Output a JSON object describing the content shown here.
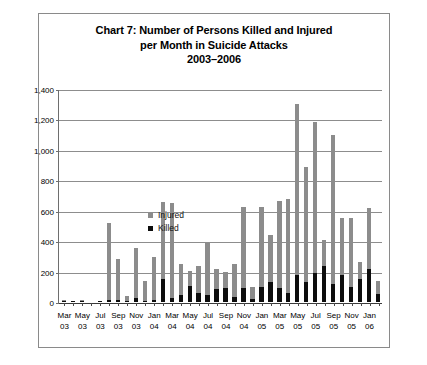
{
  "chart_data": {
    "type": "bar",
    "stacked": true,
    "title": "Chart 7: Number of Persons Killed and Injured per Month in Suicide Attacks 2003–2006",
    "title_lines": [
      "Chart 7: Number of Persons Killed and Injured",
      "per Month in Suicide Attacks",
      "2003–2006"
    ],
    "xlabel": "",
    "ylabel": "",
    "ylim": [
      0,
      1400
    ],
    "ytick_values": [
      0,
      200,
      400,
      600,
      800,
      1000,
      1200,
      1400
    ],
    "ytick_labels": [
      "0",
      "200",
      "400",
      "600",
      "800",
      "1,000",
      "1,200",
      "1,400"
    ],
    "grid": true,
    "legend_position": "upper-left-inside",
    "legend": [
      {
        "name": "Injured",
        "color": "#8c8c8c"
      },
      {
        "name": "Killed",
        "color": "#0d0d0d"
      }
    ],
    "categories": [
      "Mar 03",
      "Apr 03",
      "May 03",
      "Jun 03",
      "Jul 03",
      "Aug 03",
      "Sep 03",
      "Oct 03",
      "Nov 03",
      "Dec 03",
      "Jan 04",
      "Feb 04",
      "Mar 04",
      "Apr 04",
      "May 04",
      "Jun 04",
      "Jul 04",
      "Aug 04",
      "Sep 04",
      "Oct 04",
      "Nov 04",
      "Dec 04",
      "Jan 05",
      "Feb 05",
      "Mar 05",
      "Apr 05",
      "May 05",
      "Jun 05",
      "Jul 05",
      "Aug 05",
      "Sep 05",
      "Oct 05",
      "Nov 05",
      "Dec 05",
      "Jan 06",
      "Feb 06"
    ],
    "xtick_labels": [
      {
        "month": "Mar",
        "year": "03",
        "index": 0
      },
      {
        "month": "May",
        "year": "03",
        "index": 2
      },
      {
        "month": "Jul",
        "year": "03",
        "index": 4
      },
      {
        "month": "Sep",
        "year": "03",
        "index": 6
      },
      {
        "month": "Nov",
        "year": "03",
        "index": 8
      },
      {
        "month": "Jan",
        "year": "04",
        "index": 10
      },
      {
        "month": "Mar",
        "year": "04",
        "index": 12
      },
      {
        "month": "May",
        "year": "04",
        "index": 14
      },
      {
        "month": "Jul",
        "year": "04",
        "index": 16
      },
      {
        "month": "Sep",
        "year": "04",
        "index": 18
      },
      {
        "month": "Nov",
        "year": "04",
        "index": 20
      },
      {
        "month": "Jan",
        "year": "05",
        "index": 22
      },
      {
        "month": "Mar",
        "year": "05",
        "index": 24
      },
      {
        "month": "May",
        "year": "05",
        "index": 26
      },
      {
        "month": "Jul",
        "year": "05",
        "index": 28
      },
      {
        "month": "Sep",
        "year": "05",
        "index": 30
      },
      {
        "month": "Nov",
        "year": "05",
        "index": 32
      },
      {
        "month": "Jan",
        "year": "06",
        "index": 34
      }
    ],
    "series": [
      {
        "name": "Killed",
        "color": "#0d0d0d",
        "values": [
          5,
          3,
          4,
          0,
          2,
          12,
          10,
          4,
          25,
          8,
          12,
          150,
          25,
          45,
          105,
          60,
          45,
          85,
          90,
          35,
          95,
          20,
          100,
          130,
          90,
          60,
          175,
          130,
          190,
          235,
          120,
          180,
          100,
          150,
          215,
          55
        ]
      },
      {
        "name": "Injured",
        "color": "#8c8c8c",
        "values": [
          5,
          4,
          6,
          0,
          4,
          505,
          275,
          36,
          330,
          130,
          285,
          505,
          625,
          205,
          100,
          175,
          340,
          130,
          110,
          215,
          530,
          80,
          525,
          310,
          575,
          615,
          1125,
          755,
          990,
          175,
          975,
          375,
          455,
          110,
          400,
          80
        ]
      }
    ],
    "totals": [
      10,
      7,
      10,
      0,
      6,
      517,
      285,
      40,
      355,
      138,
      297,
      655,
      650,
      250,
      205,
      235,
      385,
      215,
      200,
      250,
      625,
      100,
      625,
      440,
      665,
      675,
      1300,
      885,
      1180,
      410,
      1095,
      555,
      555,
      260,
      615,
      135
    ]
  }
}
